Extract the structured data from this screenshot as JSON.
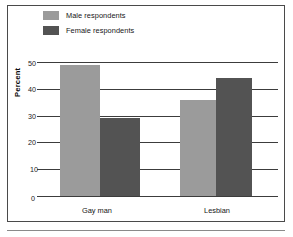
{
  "figure": {
    "background_color": "#ffffff",
    "border_color": "#4a4a4a",
    "rule_color": "#8a8a8a"
  },
  "legend": {
    "position": "top-left",
    "items": [
      {
        "label": "Male respondents",
        "color": "#9b9b9b",
        "swatch_name": "male-swatch"
      },
      {
        "label": "Female respondents",
        "color": "#535353",
        "swatch_name": "female-swatch"
      }
    ]
  },
  "axes": {
    "y_title": "Percent",
    "y_ticks": [
      "50",
      "40",
      "30",
      "20",
      "10",
      "0"
    ],
    "x_ticks": [
      "Gay man",
      "Lesbian"
    ]
  },
  "chart_data": {
    "type": "bar",
    "title": "",
    "subtitle": "",
    "xlabel": "",
    "ylabel": "Percent",
    "categories": [
      "Gay man",
      "Lesbian"
    ],
    "series": [
      {
        "name": "Male respondents",
        "color": "#9b9b9b",
        "values": [
          49,
          36
        ]
      },
      {
        "name": "Female respondents",
        "color": "#535353",
        "values": [
          29,
          44
        ]
      }
    ],
    "ylim": [
      0,
      50
    ],
    "ytick_values": [
      0,
      10,
      20,
      30,
      40,
      50
    ],
    "grid": true,
    "grid_axis": "y",
    "legend_position": "top-left",
    "annotations": []
  }
}
